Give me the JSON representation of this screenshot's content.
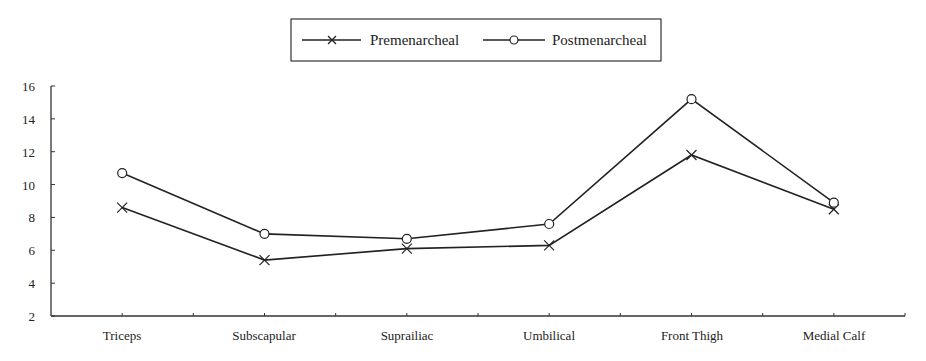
{
  "chart_data": {
    "type": "line",
    "title": "",
    "xlabel": "",
    "ylabel": "",
    "categories": [
      "Triceps",
      "Subscapular",
      "Suprailiac",
      "Umbilical",
      "Front Thigh",
      "Medial Calf"
    ],
    "series": [
      {
        "name": "Premenarcheal",
        "marker": "x",
        "values": [
          8.6,
          5.4,
          6.1,
          6.3,
          11.8,
          8.5
        ]
      },
      {
        "name": "Postmenarcheal",
        "marker": "circle",
        "values": [
          10.7,
          7.0,
          6.7,
          7.6,
          15.2,
          8.9
        ]
      }
    ],
    "ylim": [
      2,
      16
    ],
    "yticks": [
      2,
      4,
      6,
      8,
      10,
      12,
      14,
      16
    ],
    "grid": false,
    "legend_position": "top-center",
    "colors": {
      "line": "#222222",
      "axis": "#333333",
      "background": "#ffffff"
    }
  },
  "legend": {
    "items": [
      {
        "label": "Premenarcheal",
        "marker": "x-icon"
      },
      {
        "label": "Postmenarcheal",
        "marker": "circle-icon"
      }
    ]
  }
}
